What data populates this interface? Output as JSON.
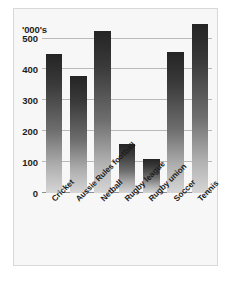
{
  "chart_data": {
    "type": "bar",
    "title": "",
    "subtitle": "",
    "xlabel": "",
    "ylabel": "'000's",
    "unit_label": "'000's",
    "categories": [
      "Cricket",
      "Aussie Rules football",
      "Netball",
      "Rugby league",
      "Rugby union",
      "Soccer",
      "Tennis"
    ],
    "values": [
      450,
      380,
      525,
      158,
      110,
      455,
      548
    ],
    "ylim": [
      0,
      560
    ],
    "yticks": [
      0,
      100,
      200,
      300,
      400,
      500
    ],
    "ytick_labels": [
      "0",
      "100",
      "200",
      "300",
      "400",
      "500"
    ],
    "grid": true,
    "grid_axis": "y",
    "legend": null,
    "legend_position": "none",
    "annotations": [],
    "bar_style": {
      "fill": "vertical-gradient",
      "top_color": "#242424",
      "bottom_color": "#d6d6d6"
    },
    "axis_color": "#b9b9b9",
    "text_color": "#1d1d1d",
    "background": "#f7f7f7",
    "frame_color": "#d8d8d8"
  }
}
